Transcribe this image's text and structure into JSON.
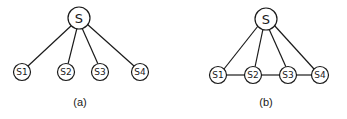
{
  "diagrams": [
    {
      "caption": "(a)",
      "root": {
        "label": "S"
      },
      "leaves": [
        {
          "label": "S1"
        },
        {
          "label": "S2"
        },
        {
          "label": "S3"
        },
        {
          "label": "S4"
        }
      ],
      "edges": "root-to-each-leaf"
    },
    {
      "caption": "(b)",
      "root": {
        "label": "S"
      },
      "leaves": [
        {
          "label": "S1"
        },
        {
          "label": "S2"
        },
        {
          "label": "S3"
        },
        {
          "label": "S4"
        }
      ],
      "edges": "root-to-each-leaf plus chain S1-S2-S3-S4"
    }
  ],
  "colors": {
    "stroke": "#1a1a1a",
    "background": "#ffffff"
  }
}
